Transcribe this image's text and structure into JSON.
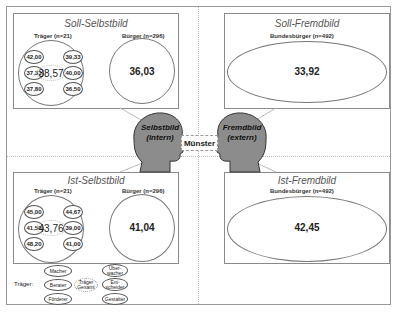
{
  "center": {
    "label": "Münster"
  },
  "heads": {
    "left": {
      "line1": "Selbstbild",
      "line2": "(intern)",
      "fill": "#8c8c8c"
    },
    "right": {
      "line1": "Fremdbild",
      "line2": "(extern)",
      "fill": "#8c8c8c"
    }
  },
  "quadrants": {
    "soll_selbst": {
      "title": "Soll-Selbstbild",
      "traeger_label": "Träger (n=21)",
      "buerger_label": "Bürger (n=296)",
      "traeger_center": "38,57",
      "traeger_values": [
        "42,00",
        "39,33",
        "37,33",
        "40,00",
        "37,80",
        "36,50"
      ],
      "buerger_value": "36,03"
    },
    "soll_fremd": {
      "title": "Soll-Fremdbild",
      "group_label": "Bundesbürger (n=492)",
      "value": "33,92"
    },
    "ist_selbst": {
      "title": "Ist-Selbstbild",
      "traeger_label": "Träger (n=21)",
      "buerger_label": "Bürger (n=296)",
      "traeger_center": "43,76",
      "traeger_values": [
        "45,00",
        "44,67",
        "41,50",
        "39,00",
        "48,20",
        "41,00"
      ],
      "buerger_value": "41,04"
    },
    "ist_fremd": {
      "title": "Ist-Fremdbild",
      "group_label": "Bundesbürger (n=492)",
      "value": "42,45"
    }
  },
  "legend": {
    "title": "Träger:",
    "items": {
      "macher": "Macher",
      "berater": "Berater",
      "foerderer": "Förderer",
      "gesamt": "Träger Gesamt",
      "ueberwacher": "Über- wacher",
      "entscheider": "Ent- scheider",
      "gestalter": "Gestalter"
    }
  }
}
